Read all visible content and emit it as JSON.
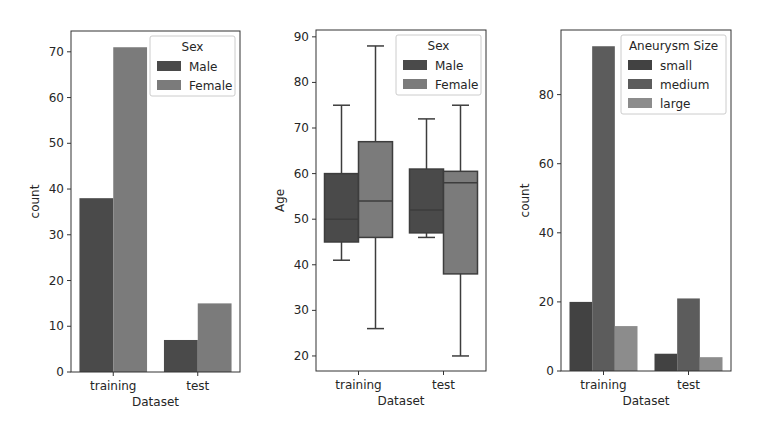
{
  "figure": {
    "width": 761,
    "height": 434,
    "background": "#ffffff"
  },
  "chart_data": [
    {
      "type": "bar",
      "title": "",
      "xlabel": "Dataset",
      "ylabel": "count",
      "categories": [
        "training",
        "test"
      ],
      "ylim": [
        0,
        74.55
      ],
      "yticks": [
        0,
        10,
        20,
        30,
        40,
        50,
        60,
        70
      ],
      "grid": false,
      "legend": {
        "title": "Sex",
        "position": "upper right"
      },
      "series": [
        {
          "name": "Male",
          "color": "#4a4a4a",
          "values": [
            38,
            7
          ]
        },
        {
          "name": "Female",
          "color": "#7b7b7b",
          "values": [
            71,
            15
          ]
        }
      ]
    },
    {
      "type": "box",
      "title": "",
      "xlabel": "Dataset",
      "ylabel": "Age",
      "categories": [
        "training",
        "test"
      ],
      "ylim": [
        16.7,
        91.5
      ],
      "yticks": [
        20,
        30,
        40,
        50,
        60,
        70,
        80,
        90
      ],
      "grid": false,
      "legend": {
        "title": "Sex",
        "position": "upper right"
      },
      "series": [
        {
          "name": "Male",
          "color": "#4a4a4a",
          "boxes": [
            {
              "whislo": 41,
              "q1": 45,
              "med": 50,
              "q3": 60,
              "whishi": 75
            },
            {
              "whislo": 46,
              "q1": 47,
              "med": 52,
              "q3": 61,
              "whishi": 72
            }
          ]
        },
        {
          "name": "Female",
          "color": "#7b7b7b",
          "boxes": [
            {
              "whislo": 26,
              "q1": 46,
              "med": 54,
              "q3": 67,
              "whishi": 88
            },
            {
              "whislo": 20,
              "q1": 38,
              "med": 58,
              "q3": 60.5,
              "whishi": 75
            }
          ]
        }
      ]
    },
    {
      "type": "bar",
      "title": "",
      "xlabel": "Dataset",
      "ylabel": "count",
      "categories": [
        "training",
        "test"
      ],
      "ylim": [
        0,
        98.7
      ],
      "yticks": [
        0,
        20,
        40,
        60,
        80
      ],
      "grid": false,
      "legend": {
        "title": "Aneurysm Size",
        "position": "upper right"
      },
      "series": [
        {
          "name": "small",
          "color": "#424242",
          "values": [
            20,
            5
          ]
        },
        {
          "name": "medium",
          "color": "#5c5c5c",
          "values": [
            94,
            21
          ]
        },
        {
          "name": "large",
          "color": "#8c8c8c",
          "values": [
            13,
            4
          ]
        }
      ]
    }
  ],
  "layout": {
    "axes": [
      {
        "left": 71,
        "top": 31,
        "right": 240,
        "bottom": 372
      },
      {
        "left": 316,
        "top": 30,
        "right": 486,
        "bottom": 371
      },
      {
        "left": 561,
        "top": 30,
        "right": 731,
        "bottom": 371
      }
    ]
  }
}
